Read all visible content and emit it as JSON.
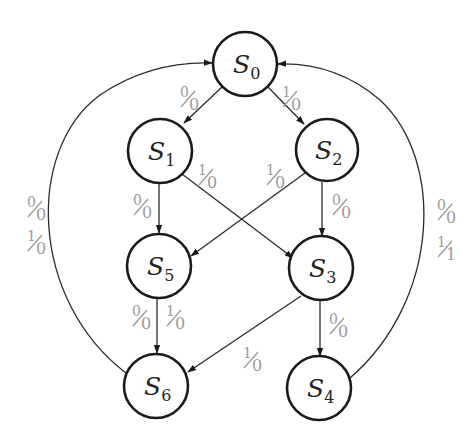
{
  "diagram": {
    "type": "state-diagram",
    "states": [
      {
        "id": "S0",
        "name": "S",
        "sub": "0",
        "cx": 245,
        "cy": 64
      },
      {
        "id": "S1",
        "name": "S",
        "sub": "1",
        "cx": 160,
        "cy": 151
      },
      {
        "id": "S2",
        "name": "S",
        "sub": "2",
        "cx": 327,
        "cy": 150
      },
      {
        "id": "S5",
        "name": "S",
        "sub": "5",
        "cx": 159,
        "cy": 266
      },
      {
        "id": "S3",
        "name": "S",
        "sub": "3",
        "cx": 321,
        "cy": 268
      },
      {
        "id": "S6",
        "name": "S",
        "sub": "6",
        "cx": 156,
        "cy": 386
      },
      {
        "id": "S4",
        "name": "S",
        "sub": "4",
        "cx": 319,
        "cy": 388
      }
    ],
    "transitions": [
      {
        "from": "S0",
        "to": "S1",
        "label": {
          "in": "0",
          "out": "0"
        }
      },
      {
        "from": "S0",
        "to": "S2",
        "label": {
          "in": "1",
          "out": "0"
        }
      },
      {
        "from": "S1",
        "to": "S5",
        "label": {
          "in": "0",
          "out": "0"
        }
      },
      {
        "from": "S1",
        "to": "S3",
        "label": {
          "in": "1",
          "out": "0"
        }
      },
      {
        "from": "S2",
        "to": "S5",
        "label": {
          "in": "1",
          "out": "0"
        }
      },
      {
        "from": "S2",
        "to": "S3",
        "label": {
          "in": "0",
          "out": "0"
        }
      },
      {
        "from": "S5",
        "to": "S6",
        "label": {
          "in": "0",
          "out": "0"
        }
      },
      {
        "from": "S5",
        "to": "S6",
        "label": {
          "in": "1",
          "out": "0"
        }
      },
      {
        "from": "S3",
        "to": "S6",
        "label": {
          "in": "1",
          "out": "0"
        }
      },
      {
        "from": "S3",
        "to": "S4",
        "label": {
          "in": "0",
          "out": "0"
        }
      },
      {
        "from": "S6",
        "to": "S0",
        "label": {
          "in": "0",
          "out": "0"
        }
      },
      {
        "from": "S6",
        "to": "S0",
        "label": {
          "in": "1",
          "out": "0"
        }
      },
      {
        "from": "S4",
        "to": "S0",
        "label": {
          "in": "0",
          "out": "0"
        }
      },
      {
        "from": "S4",
        "to": "S0",
        "label": {
          "in": "1",
          "out": "1"
        }
      }
    ],
    "labels": {
      "l_s0_s1": {
        "in": "0",
        "out": "0"
      },
      "l_s0_s2": {
        "in": "1",
        "out": "0"
      },
      "l_s1_s5": {
        "in": "0",
        "out": "0"
      },
      "l_s1_s3": {
        "in": "1",
        "out": "0"
      },
      "l_s2_s5": {
        "in": "1",
        "out": "0"
      },
      "l_s2_s3": {
        "in": "0",
        "out": "0"
      },
      "l_s5_s6_a": {
        "in": "0",
        "out": "0"
      },
      "l_s5_s6_b": {
        "in": "1",
        "out": "0"
      },
      "l_s3_s6": {
        "in": "1",
        "out": "0"
      },
      "l_s3_s4": {
        "in": "0",
        "out": "0"
      },
      "l_s6_s0_a": {
        "in": "0",
        "out": "0"
      },
      "l_s6_s0_b": {
        "in": "1",
        "out": "0"
      },
      "l_s4_s0_a": {
        "in": "0",
        "out": "0"
      },
      "l_s4_s0_b": {
        "in": "1",
        "out": "1"
      }
    },
    "colors": {
      "stroke": "#1a1a1a",
      "label": "#9a9a9a",
      "background": "#ffffff"
    }
  }
}
